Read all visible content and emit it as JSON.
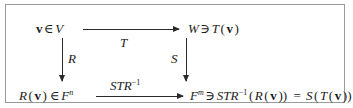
{
  "diagram": {
    "type": "commutative-diagram",
    "title": "",
    "border_color": "#9a9a9a",
    "text_color": "#1c1c1c",
    "arrow_color": "#2a2a2a",
    "background": "#ffffff",
    "nodes": {
      "top_left": {
        "id": "node-top-left",
        "text": "v ∈ V",
        "vector": "v",
        "relation": "∈",
        "space": "V"
      },
      "top_right": {
        "id": "node-top-right",
        "text": "W ∋ T(v)",
        "space": "W",
        "relation": "∋",
        "element": "T(v)"
      },
      "bottom_left": {
        "id": "node-bottom-left",
        "text": "R(v) ∈ F^n",
        "element": "R(v)",
        "relation": "∈",
        "space": "F",
        "space_exponent": "n"
      },
      "bottom_right": {
        "id": "node-bottom-right",
        "text": "F^m ∋ STR^-1(R(v)) = S(T(v))",
        "space": "F",
        "space_exponent": "m",
        "relation": "∋",
        "lhs": "STR⁻¹(R(v))",
        "equals": "=",
        "rhs": "S(T(v))"
      }
    },
    "arrows": [
      {
        "id": "arrow-top",
        "from": "top_left",
        "to": "top_right",
        "direction": "right",
        "label": "T",
        "label_position": "below"
      },
      {
        "id": "arrow-left",
        "from": "top_left",
        "to": "bottom_left",
        "direction": "down",
        "label": "R",
        "label_position": "right"
      },
      {
        "id": "arrow-right",
        "from": "top_right",
        "to": "bottom_right",
        "direction": "down",
        "label": "S",
        "label_position": "left"
      },
      {
        "id": "arrow-bottom",
        "from": "bottom_left",
        "to": "bottom_right",
        "direction": "right",
        "label": "STR⁻¹",
        "label_base": "STR",
        "label_exponent": "−1",
        "label_position": "above"
      }
    ]
  }
}
